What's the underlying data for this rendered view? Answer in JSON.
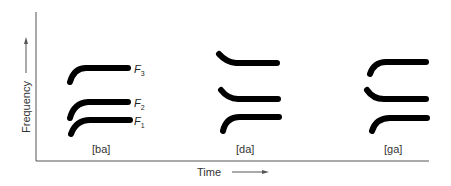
{
  "figure": {
    "type": "schematic spectrogram of formant transitions",
    "y_axis_label": "Frequency",
    "x_axis_label": "Time",
    "syllables": [
      {
        "label": "[ba]",
        "F1": "rising",
        "F2": "rising",
        "F3": "rising"
      },
      {
        "label": "[da]",
        "F1": "rising",
        "F2": "falling",
        "F3": "falling"
      },
      {
        "label": "[ga]",
        "F1": "rising",
        "F2": "falling",
        "F3": "rising"
      }
    ],
    "formant_labels": [
      {
        "base": "F",
        "sub": "3"
      },
      {
        "base": "F",
        "sub": "2"
      },
      {
        "base": "F",
        "sub": "1"
      }
    ]
  }
}
